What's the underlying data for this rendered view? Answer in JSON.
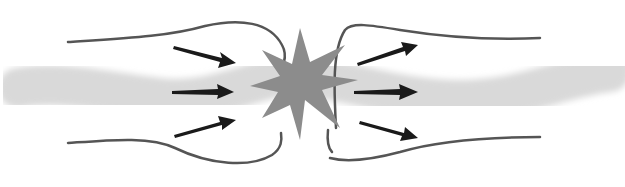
{
  "diagram": {
    "title": "",
    "colors": {
      "background": "#ffffff",
      "band": "#d9d9d9",
      "field_lines": "#555555",
      "arrows": "#1a1a1a",
      "burst": "#8c8c8c"
    },
    "elements": {
      "left_band": "wavy-band",
      "right_band": "wavy-band",
      "burst": "starburst-icon",
      "left_arrows": 3,
      "right_arrows": 3,
      "left_field_lines": 2,
      "right_field_lines": 2
    }
  }
}
